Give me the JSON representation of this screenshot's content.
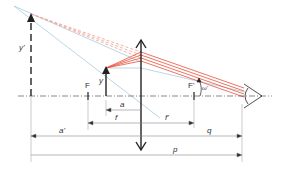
{
  "diagram": {
    "labels": {
      "image_height": "y'",
      "object_height": "y",
      "focal_point_front": "F",
      "focal_point_back": "F'",
      "angle": "ω'",
      "object_distance": "a",
      "focal_length_front": "f",
      "focal_length_back": "f'",
      "image_distance": "a'",
      "eye_distance": "q",
      "total_distance": "p"
    },
    "colors": {
      "rays_real": "#e8503a",
      "rays_virtual": "#f4a89a",
      "construction_lines": "#a9cbe0",
      "axis": "#555555",
      "arrows": "#222222",
      "dimension_lines": "#888888"
    }
  }
}
